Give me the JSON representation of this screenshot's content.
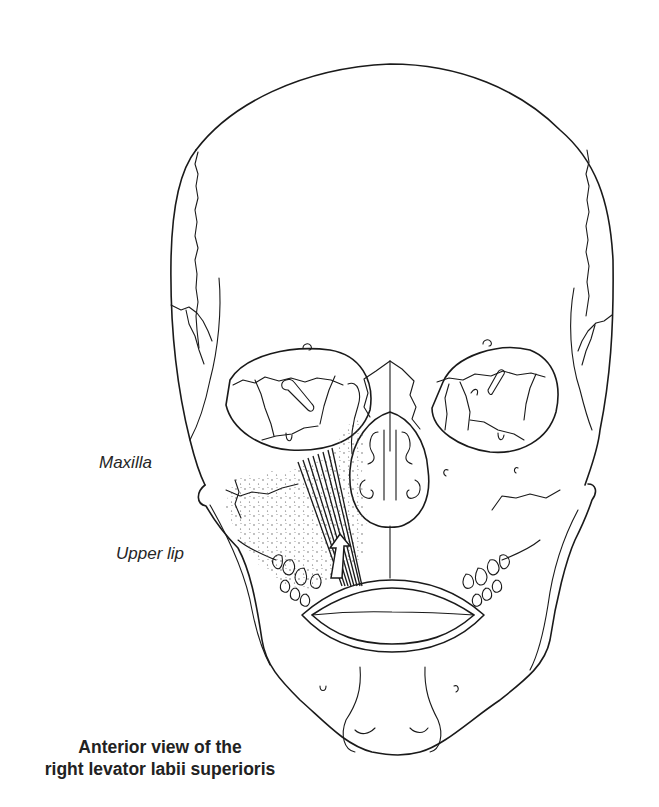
{
  "figure": {
    "title": "Anterior view of the right levator labii superioris",
    "caption_lines": [
      "Anterior view of the",
      "right levator labii superioris"
    ],
    "labels": {
      "maxilla": "Maxilla",
      "upper_lip": "Upper lip"
    },
    "arrow_direction": "up",
    "colors": {
      "line": "#1a1a1a",
      "background": "#ffffff",
      "stipple": "#555555"
    }
  }
}
